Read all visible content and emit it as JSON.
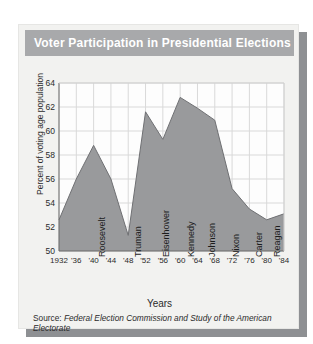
{
  "banner": {
    "title": "Voter Participation in Presidential Elections"
  },
  "axes": {
    "xlabel": "Years",
    "ylabel": "Percent of voting age population",
    "yticks": [
      "64",
      "62",
      "60",
      "58",
      "56",
      "54",
      "52",
      "50"
    ],
    "xticks": [
      "1932",
      "'36",
      "'40",
      "'44",
      "'48",
      "'52",
      "'56",
      "'60",
      "'64",
      "'68",
      "'72",
      "'76",
      "'80",
      "'84"
    ]
  },
  "source": {
    "prefix": "Source:",
    "text": "Federal Election Commission and Study of the American Electorate"
  },
  "presidents": [
    {
      "name": "Roosevelt"
    },
    {
      "name": "Truman"
    },
    {
      "name": "Eisenhower"
    },
    {
      "name": "Kennedy"
    },
    {
      "name": "Johnson"
    },
    {
      "name": "Nixon"
    },
    {
      "name": "Carter"
    },
    {
      "name": "Reagan"
    }
  ],
  "colors": {
    "banner": "#a8a9ab",
    "card": "#f2f2f0",
    "area_fill": "#999a9c",
    "shadow": "#8e9093",
    "grid": "#d9d9d9",
    "plot_bg": "#fdfdfd"
  },
  "chart_data": {
    "type": "area",
    "title": "Voter Participation in Presidential Elections",
    "xlabel": "Years",
    "ylabel": "Percent of voting age population",
    "ylim": [
      50,
      64
    ],
    "ytick_step": 2,
    "grid": true,
    "legend": "none",
    "x": [
      1932,
      1936,
      1940,
      1944,
      1948,
      1952,
      1956,
      1960,
      1964,
      1968,
      1972,
      1976,
      1980,
      1984
    ],
    "categories": [
      "1932",
      "'36",
      "'40",
      "'44",
      "'48",
      "'52",
      "'56",
      "'60",
      "'64",
      "'68",
      "'72",
      "'76",
      "'80",
      "'84"
    ],
    "values": [
      52.6,
      56.0,
      58.8,
      56.0,
      51.3,
      61.6,
      59.3,
      62.8,
      61.9,
      60.9,
      55.2,
      53.5,
      52.6,
      53.1
    ],
    "annotations": [
      {
        "label": "Roosevelt",
        "x_range": [
          1932,
          1944
        ]
      },
      {
        "label": "Truman",
        "x_range": [
          1945,
          1952
        ]
      },
      {
        "label": "Eisenhower",
        "x_range": [
          1953,
          1960
        ]
      },
      {
        "label": "Kennedy",
        "x_range": [
          1961,
          1963
        ]
      },
      {
        "label": "Johnson",
        "x_range": [
          1964,
          1968
        ]
      },
      {
        "label": "Nixon",
        "x_range": [
          1969,
          1974
        ]
      },
      {
        "label": "Carter",
        "x_range": [
          1977,
          1980
        ]
      },
      {
        "label": "Reagan",
        "x_range": [
          1981,
          1984
        ]
      }
    ],
    "source": "Source: Federal Election Commission and Study of the American Electorate"
  }
}
